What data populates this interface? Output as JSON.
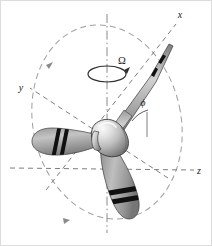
{
  "figure": {
    "background_color": "#ffffff",
    "border_color": "#d8d8d8"
  },
  "axes": [
    {
      "id": "x",
      "label": "x",
      "label_x": 180,
      "label_y": 18,
      "style": "dashed",
      "color": "#6e6e6e",
      "description": "axis directed up and to the right"
    },
    {
      "id": "y",
      "label": "y",
      "label_x": 21,
      "label_y": 91,
      "style": "dashed",
      "color": "#6e6e6e",
      "description": "axis directed up and to the left"
    },
    {
      "id": "z",
      "label": "z",
      "label_x": 199,
      "label_y": 174,
      "style": "dashed",
      "color": "#6e6e6e",
      "description": "axis directed down and to the right"
    }
  ],
  "annotations": [
    {
      "id": "omega",
      "label": "Ω",
      "meaning": "angular-velocity-of-rotation",
      "label_x": 118,
      "label_y": 64,
      "has_curved_arrow": true
    },
    {
      "id": "phi",
      "label": "ϕ",
      "meaning": "blade-angular-position",
      "label_x": 143,
      "label_y": 106,
      "has_arc": true
    }
  ],
  "spin_axis": {
    "id": "vertical-spin-axis",
    "style": "dash-dot",
    "color": "#7a7a7a",
    "top_y": 14,
    "bottom_y": 233
  },
  "rotation_path": {
    "id": "rotation-ellipse",
    "style": "dashed",
    "color": "#9a9a9a",
    "center_x": 107,
    "center_y": 122,
    "radius_x": 74,
    "radius_y": 98,
    "rotation_deg": -12,
    "arrowheads": 2,
    "direction": "counterclockwise-viewed-from-above"
  },
  "propeller": {
    "hub": {
      "id": "spinner-hub",
      "center_x": 107,
      "center_y": 133,
      "highlight_color": "#f2f2f2",
      "mid_color": "#bdbdbd",
      "shadow_color": "#6f6f6f",
      "outline_color": "#2a2a2a"
    },
    "blades": [
      {
        "id": "blade-upper-right",
        "orientation": "edge-on",
        "tip_x": 171,
        "tip_y": 42,
        "fill_light": "#c9c9c9",
        "fill_dark": "#8d8d8d",
        "stripes": 2,
        "stripe_color": "#101010"
      },
      {
        "id": "blade-left",
        "orientation": "flat",
        "tip_x": 34,
        "tip_y": 148,
        "fill_light": "#b9b9b9",
        "fill_dark": "#8a8a8a",
        "stripes": 2,
        "stripe_color": "#101010"
      },
      {
        "id": "blade-lower",
        "orientation": "flat",
        "tip_x": 129,
        "tip_y": 216,
        "fill_light": "#b4b4b4",
        "fill_dark": "#858585",
        "stripes": 2,
        "stripe_color": "#101010"
      }
    ]
  }
}
